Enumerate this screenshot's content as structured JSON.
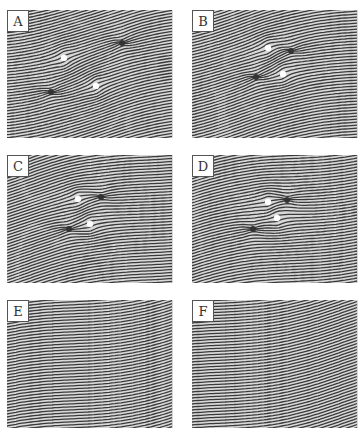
{
  "figure": {
    "panels": [
      {
        "id": "A",
        "label": "A",
        "left": 7,
        "top": 10,
        "seed": 1,
        "defects": [
          {
            "type": "dark",
            "x": 115,
            "y": 33
          },
          {
            "type": "white",
            "x": 57,
            "y": 48
          },
          {
            "type": "white",
            "x": 89,
            "y": 76
          },
          {
            "type": "dark",
            "x": 44,
            "y": 82
          }
        ]
      },
      {
        "id": "B",
        "label": "B",
        "left": 192,
        "top": 10,
        "seed": 2,
        "defects": [
          {
            "type": "white",
            "x": 76,
            "y": 38
          },
          {
            "type": "dark",
            "x": 99,
            "y": 41
          },
          {
            "type": "white",
            "x": 91,
            "y": 64
          },
          {
            "type": "dark",
            "x": 64,
            "y": 67
          }
        ]
      },
      {
        "id": "C",
        "label": "C",
        "left": 7,
        "top": 155,
        "seed": 3,
        "defects": [
          {
            "type": "white",
            "x": 71,
            "y": 44
          },
          {
            "type": "dark",
            "x": 94,
            "y": 42
          },
          {
            "type": "white",
            "x": 83,
            "y": 69
          },
          {
            "type": "dark",
            "x": 62,
            "y": 74
          }
        ]
      },
      {
        "id": "D",
        "label": "D",
        "left": 192,
        "top": 155,
        "seed": 4,
        "defects": [
          {
            "type": "white",
            "x": 76,
            "y": 47
          },
          {
            "type": "dark",
            "x": 95,
            "y": 45
          },
          {
            "type": "white",
            "x": 85,
            "y": 63
          },
          {
            "type": "dark",
            "x": 61,
            "y": 74
          }
        ]
      },
      {
        "id": "E",
        "label": "E",
        "left": 7,
        "top": 300,
        "seed": 5,
        "defects": []
      },
      {
        "id": "F",
        "label": "F",
        "left": 192,
        "top": 300,
        "seed": 6,
        "defects": []
      }
    ]
  },
  "colors": {
    "stripe_dark": "#3a3a3a",
    "stripe_light": "#d8d8d8",
    "background": "#ffffff"
  }
}
